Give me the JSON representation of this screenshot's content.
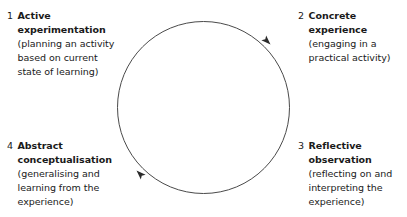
{
  "diagram": {
    "type": "cyclical-process",
    "background_color": "#ffffff",
    "stroke_color": "#4a4a4a",
    "text_color": "#1a1a1a",
    "circle": {
      "center_x": 203.5,
      "center_y": 107.5,
      "radius": 86,
      "stroke_width": 1,
      "direction": "clockwise"
    },
    "arrowheads": [
      {
        "name": "arrowhead-upper-right",
        "angle_deg": -45,
        "x": 272,
        "y": 46
      },
      {
        "name": "arrowhead-lower-left",
        "angle_deg": 135,
        "x": 135,
        "y": 169
      }
    ],
    "stages": [
      {
        "number": "1",
        "title": "Active\nexperimentation",
        "detail": "(planning an activity\nbased on current\nstate of learning)",
        "position": "top-left"
      },
      {
        "number": "2",
        "title": "Concrete\nexperience",
        "detail": "(engaging in a\npractical activity)",
        "position": "top-right"
      },
      {
        "number": "3",
        "title": "Reflective\nobservation",
        "detail": "(reflecting on and\ninterpreting the\nexperience)",
        "position": "bottom-right"
      },
      {
        "number": "4",
        "title": "Abstract\nconceptualisation",
        "detail": "(generalising and\nlearning from the\nexperience)",
        "position": "bottom-left"
      }
    ]
  }
}
